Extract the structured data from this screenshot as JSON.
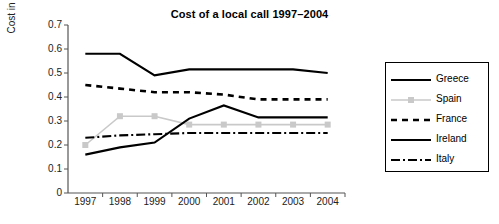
{
  "chart": {
    "title": "Cost of a local call 1997–2004",
    "ylabel": "Cost in Euro"
  },
  "legend": {
    "items": [
      {
        "label": "Greece"
      },
      {
        "label": "Spain"
      },
      {
        "label": "France"
      },
      {
        "label": "Ireland"
      },
      {
        "label": "Italy"
      }
    ]
  },
  "axis": {
    "yticks": [
      "0.7",
      "0.6",
      "0.5",
      "0.4",
      "0.3",
      "0.2",
      "0.1",
      "0"
    ],
    "xticks": [
      "1997",
      "1998",
      "1999",
      "2000",
      "2001",
      "2002",
      "2003",
      "2004"
    ]
  },
  "colors": {
    "greece": "#000000",
    "spain": "#c9c9c9",
    "france": "#000000",
    "ireland": "#000000",
    "italy": "#000000",
    "axis": "#555555",
    "background": "#ffffff"
  },
  "chart_data": {
    "type": "line",
    "title": "Cost of a local call 1997–2004",
    "xlabel": "",
    "ylabel": "Cost in Euro",
    "categories": [
      "1997",
      "1998",
      "1999",
      "2000",
      "2001",
      "2002",
      "2003",
      "2004"
    ],
    "ylim": [
      0,
      0.7
    ],
    "ytick_step": 0.1,
    "grid": false,
    "legend_position": "right",
    "series": [
      {
        "name": "Greece",
        "values": [
          0.58,
          0.58,
          0.49,
          0.515,
          0.515,
          0.515,
          0.515,
          0.5
        ]
      },
      {
        "name": "Spain",
        "values": [
          0.2,
          0.32,
          0.32,
          0.285,
          0.285,
          0.285,
          0.285,
          0.285
        ]
      },
      {
        "name": "France",
        "values": [
          0.45,
          0.435,
          0.42,
          0.42,
          0.41,
          0.39,
          0.39,
          0.39
        ]
      },
      {
        "name": "Ireland",
        "values": [
          0.16,
          0.19,
          0.21,
          0.31,
          0.365,
          0.315,
          0.315,
          0.315
        ]
      },
      {
        "name": "Italy",
        "values": [
          0.23,
          0.24,
          0.245,
          0.25,
          0.25,
          0.25,
          0.25,
          0.25
        ]
      }
    ]
  }
}
